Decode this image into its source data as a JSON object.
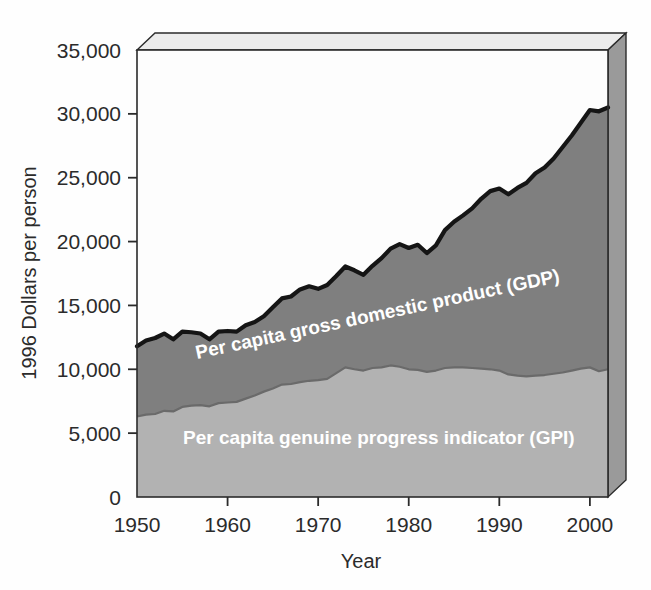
{
  "chart_data": {
    "type": "area",
    "stacked": true,
    "title": "",
    "xlabel": "Year",
    "ylabel": "1996 Dollars per person",
    "xlim": [
      1950,
      2002
    ],
    "ylim": [
      0,
      35000
    ],
    "xticks": [
      1950,
      1960,
      1970,
      1980,
      1990,
      2000
    ],
    "xtick_labels": [
      "1950",
      "1960",
      "1970",
      "1980",
      "1990",
      "2000"
    ],
    "yticks": [
      0,
      5000,
      10000,
      15000,
      20000,
      25000,
      30000,
      35000
    ],
    "ytick_labels": [
      "0",
      "5,000",
      "10,000",
      "15,000",
      "20,000",
      "25,000",
      "30,000",
      "35,000"
    ],
    "grid": false,
    "legend_position": "inline-annotations",
    "colors": {
      "gdp_fill": "#7f7f7f",
      "gpi_fill": "#b2b2b2",
      "gdp_outline": "#151515",
      "gpi_outline": "#6a6a6a",
      "axis": "#2b2b2b",
      "panel_background": "#fdfdfd",
      "depth_face": "#9a9a9a",
      "depth_top": "#e8e8e8",
      "label_text": "#ffffff"
    },
    "x": [
      1950,
      1951,
      1952,
      1953,
      1954,
      1955,
      1956,
      1957,
      1958,
      1959,
      1960,
      1961,
      1962,
      1963,
      1964,
      1965,
      1966,
      1967,
      1968,
      1969,
      1970,
      1971,
      1972,
      1973,
      1974,
      1975,
      1976,
      1977,
      1978,
      1979,
      1980,
      1981,
      1982,
      1983,
      1984,
      1985,
      1986,
      1987,
      1988,
      1989,
      1990,
      1991,
      1992,
      1993,
      1994,
      1995,
      1996,
      1997,
      1998,
      1999,
      2000,
      2001,
      2002
    ],
    "series": [
      {
        "name": "Per capita genuine progress indicator (GPI)",
        "key": "gpi",
        "values": [
          6300,
          6450,
          6500,
          6750,
          6700,
          7050,
          7150,
          7200,
          7100,
          7350,
          7400,
          7450,
          7700,
          7950,
          8250,
          8500,
          8800,
          8850,
          9000,
          9100,
          9150,
          9250,
          9700,
          10150,
          10000,
          9900,
          10100,
          10150,
          10300,
          10200,
          10000,
          9950,
          9800,
          9900,
          10100,
          10150,
          10150,
          10100,
          10050,
          10000,
          9900,
          9600,
          9500,
          9450,
          9500,
          9550,
          9650,
          9750,
          9900,
          10050,
          10150,
          9850,
          10000
        ]
      },
      {
        "name": "Per capita gross domestic product (GDP)",
        "key": "gdp",
        "values": [
          11800,
          12250,
          12450,
          12800,
          12350,
          12950,
          12900,
          12800,
          12350,
          12950,
          13000,
          12950,
          13450,
          13700,
          14150,
          14850,
          15550,
          15700,
          16250,
          16500,
          16300,
          16600,
          17300,
          18050,
          17750,
          17400,
          18100,
          18700,
          19450,
          19800,
          19500,
          19750,
          19100,
          19700,
          20900,
          21550,
          22050,
          22600,
          23350,
          23950,
          24150,
          23700,
          24200,
          24600,
          25350,
          25800,
          26500,
          27400,
          28300,
          29300,
          30300,
          30200,
          30500
        ]
      }
    ],
    "annotations": [
      {
        "text": "Per capita gross domestic product (GDP)",
        "series": "gdp",
        "rotation_deg": -12
      },
      {
        "text": "Per capita genuine progress indicator (GPI)",
        "series": "gpi",
        "rotation_deg": 0
      }
    ]
  }
}
